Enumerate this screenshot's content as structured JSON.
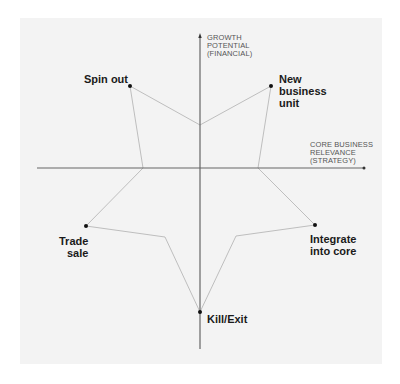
{
  "diagram": {
    "type": "star-shaped strategic options map",
    "axes": {
      "vertical": {
        "label": "GROWTH\nPOTENTIAL\n(FINANCIAL)"
      },
      "horizontal": {
        "label": "CORE BUSINESS\nRELEVANCE\n(STRATEGY)"
      }
    },
    "points": [
      {
        "id": "spin-out",
        "label": "Spin out"
      },
      {
        "id": "new-business-unit",
        "label": "New\nbusiness\nunit"
      },
      {
        "id": "integrate-into-core",
        "label": "Integrate\ninto core"
      },
      {
        "id": "kill-exit",
        "label": "Kill/Exit"
      },
      {
        "id": "trade-sale",
        "label": "Trade\nsale"
      }
    ],
    "colors": {
      "background": "#f3f3f3",
      "axis": "#555555",
      "star_line": "#aaaaaa",
      "dot": "#111111",
      "label": "#1a1a1a"
    }
  }
}
